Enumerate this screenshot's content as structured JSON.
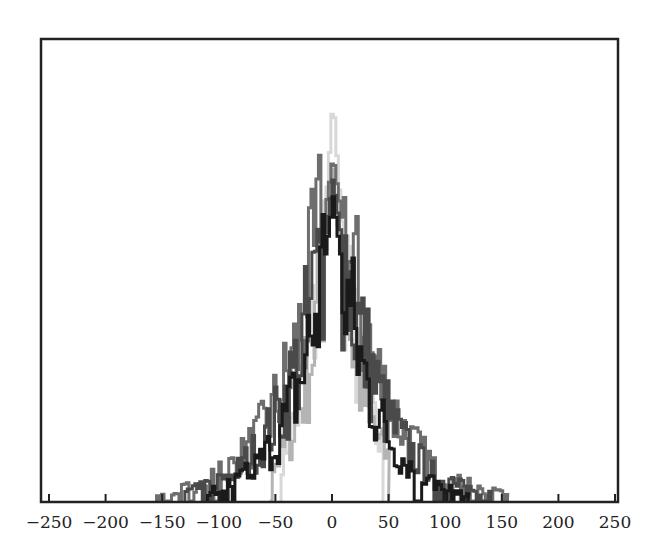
{
  "chart_data": {
    "type": "line",
    "title": "",
    "xlabel": "",
    "ylabel": "",
    "xlim": [
      -250,
      250
    ],
    "ylim": [
      0,
      1
    ],
    "grid": false,
    "legend": null,
    "x_ticks": [
      -250,
      -200,
      -150,
      -100,
      -50,
      0,
      50,
      100,
      150,
      200,
      250
    ],
    "x_tick_labels": [
      "−250",
      "−200",
      "−150",
      "−100",
      "−50",
      "0",
      "50",
      "100",
      "150",
      "200",
      "250"
    ],
    "y_ticks_shown": false,
    "series": [
      {
        "name": "series-1 (lightest)",
        "color": "#d8d8d8",
        "peak": 0.88,
        "half_width": 40,
        "support": [
          -45,
          45
        ]
      },
      {
        "name": "series-2 (light gray)",
        "color": "#b4b4b4",
        "peak": 0.72,
        "half_width": 45,
        "support": [
          -55,
          50
        ]
      },
      {
        "name": "series-3 (mid gray)",
        "color": "#6e6e6e",
        "peak": 0.75,
        "half_width": 75,
        "support": [
          -155,
          155
        ]
      },
      {
        "name": "series-4 (dark gray)",
        "color": "#4a4a4a",
        "peak": 0.7,
        "half_width": 70,
        "support": [
          -130,
          140
        ]
      },
      {
        "name": "series-5 (black)",
        "color": "#1a1a1a",
        "peak": 0.66,
        "half_width": 60,
        "support": [
          -110,
          120
        ]
      }
    ],
    "x": [
      -150,
      -140,
      -130,
      -120,
      -110,
      -100,
      -90,
      -80,
      -70,
      -60,
      -50,
      -40,
      -30,
      -20,
      -10,
      0,
      10,
      20,
      30,
      40,
      50,
      60,
      70,
      80,
      90,
      100,
      110,
      120,
      130,
      140,
      150
    ],
    "values_by_series": {
      "series-1 (lightest)": [
        0,
        0,
        0,
        0,
        0,
        0,
        0,
        0,
        0,
        0,
        0,
        0.02,
        0.1,
        0.25,
        0.48,
        0.88,
        0.48,
        0.25,
        0.1,
        0.02,
        0,
        0,
        0,
        0,
        0,
        0,
        0,
        0,
        0,
        0,
        0
      ],
      "series-2 (light gray)": [
        0,
        0,
        0,
        0,
        0,
        0,
        0,
        0,
        0,
        0.02,
        0.06,
        0.12,
        0.22,
        0.35,
        0.52,
        0.72,
        0.52,
        0.35,
        0.22,
        0.12,
        0.06,
        0.02,
        0,
        0,
        0,
        0,
        0,
        0,
        0,
        0,
        0
      ],
      "series-3 (mid gray)": [
        0.06,
        0.06,
        0.07,
        0.08,
        0.1,
        0.12,
        0.14,
        0.17,
        0.2,
        0.24,
        0.29,
        0.35,
        0.42,
        0.52,
        0.62,
        0.75,
        0.62,
        0.52,
        0.42,
        0.35,
        0.29,
        0.24,
        0.2,
        0.17,
        0.14,
        0.12,
        0.1,
        0.08,
        0.07,
        0.06,
        0.06
      ],
      "series-4 (dark gray)": [
        0,
        0,
        0.04,
        0.06,
        0.08,
        0.1,
        0.12,
        0.15,
        0.18,
        0.22,
        0.27,
        0.33,
        0.4,
        0.49,
        0.58,
        0.7,
        0.58,
        0.49,
        0.4,
        0.33,
        0.27,
        0.22,
        0.18,
        0.15,
        0.12,
        0.1,
        0.08,
        0.06,
        0.04,
        0.03,
        0
      ],
      "series-5 (black)": [
        0,
        0,
        0,
        0,
        0.05,
        0.08,
        0.1,
        0.13,
        0.16,
        0.2,
        0.25,
        0.31,
        0.38,
        0.46,
        0.55,
        0.66,
        0.55,
        0.46,
        0.38,
        0.31,
        0.25,
        0.2,
        0.16,
        0.13,
        0.1,
        0.08,
        0.05,
        0.03,
        0,
        0,
        0
      ]
    }
  },
  "axes": {
    "frame_color": "#222222",
    "x_tick_labels": [
      "−250",
      "−200",
      "−150",
      "−100",
      "−50",
      "0",
      "50",
      "100",
      "150",
      "200",
      "250"
    ]
  }
}
